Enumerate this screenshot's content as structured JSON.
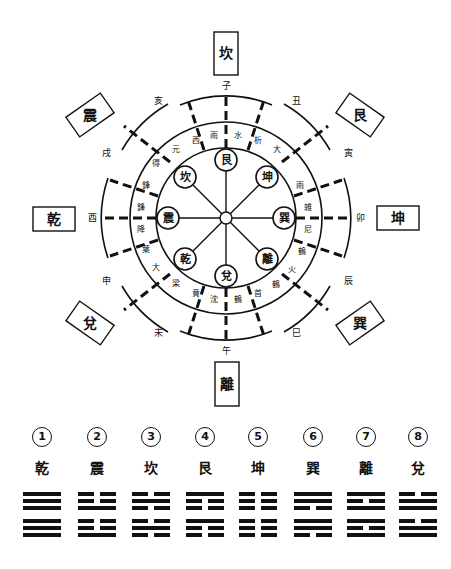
{
  "diagram": {
    "center": {
      "x": 226,
      "y": 218
    },
    "top_box": "坎",
    "bottom_box": "離",
    "left_box": "乾",
    "right_box": "坤",
    "nw_box": "震",
    "ne_box": "艮",
    "sw_box": "兌",
    "se_box": "巽",
    "branches": {
      "top": "子",
      "bottom": "午",
      "left": "酉",
      "right": "卯",
      "nw_outer": "亥",
      "nw_inner": "戌",
      "ne_inner": "丑",
      "ne_outer": "寅",
      "sw_inner": "申",
      "sw_outer": "未",
      "se_inner": "辰",
      "se_outer": "巳"
    },
    "inner_circles": [
      "艮",
      "坤",
      "巽",
      "離",
      "兌",
      "乾",
      "震",
      "坎"
    ],
    "ring_labels": {
      "top": [
        "雨",
        "水"
      ],
      "top_right": [
        "析",
        "大"
      ],
      "right_upper": [
        "雨"
      ],
      "right": [
        "雑",
        "尼"
      ],
      "right_lower": [
        "鶴",
        "火"
      ],
      "bottom_right": [
        "鶴",
        "首"
      ],
      "bottom": [
        "沈",
        "鶴"
      ],
      "bottom_left": [
        "賁",
        "梁"
      ],
      "left_lower": [
        "大",
        "葉"
      ],
      "left": [
        "鋒",
        "降"
      ],
      "left_upper": [
        "鋒",
        "得"
      ],
      "top_left": [
        "元",
        "西"
      ]
    }
  },
  "legend": {
    "items": [
      {
        "num": "1",
        "name": "乾",
        "lines": [
          1,
          1,
          1,
          1,
          1,
          1
        ]
      },
      {
        "num": "2",
        "name": "震",
        "lines": [
          0,
          0,
          1,
          0,
          0,
          1
        ]
      },
      {
        "num": "3",
        "name": "坎",
        "lines": [
          0,
          1,
          0,
          0,
          1,
          0
        ]
      },
      {
        "num": "4",
        "name": "艮",
        "lines": [
          1,
          0,
          0,
          1,
          0,
          0
        ]
      },
      {
        "num": "5",
        "name": "坤",
        "lines": [
          0,
          0,
          0,
          0,
          0,
          0
        ]
      },
      {
        "num": "6",
        "name": "巽",
        "lines": [
          1,
          1,
          0,
          1,
          1,
          0
        ]
      },
      {
        "num": "7",
        "name": "離",
        "lines": [
          1,
          0,
          1,
          1,
          0,
          1
        ]
      },
      {
        "num": "8",
        "name": "兌",
        "lines": [
          0,
          1,
          1,
          0,
          1,
          1
        ]
      }
    ]
  }
}
